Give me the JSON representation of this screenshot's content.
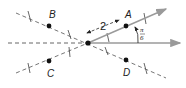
{
  "diagram": {
    "type": "polar-coordinates-points",
    "pole": {
      "x": 88,
      "y": 43
    },
    "polar_axis_label": "",
    "points": [
      {
        "name": "A",
        "label": "A"
      },
      {
        "name": "B",
        "label": "B"
      },
      {
        "name": "C",
        "label": "C"
      },
      {
        "name": "D",
        "label": "D"
      }
    ],
    "distance_label": "2",
    "angle_label": {
      "numerator": "π",
      "denominator": "6"
    },
    "colors": {
      "ray": "#9a9a9a",
      "dashed": "#555555",
      "point": "#111111"
    }
  }
}
